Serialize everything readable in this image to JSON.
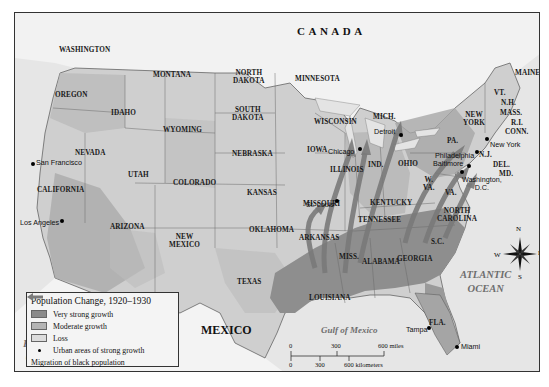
{
  "map": {
    "title": "Population Change, 1920–1930",
    "countries": {
      "canada": "CANADA",
      "mexico": "MEXICO"
    },
    "water_bodies": {
      "pacific": [
        "PACIFIC",
        "OCEAN"
      ],
      "atlantic": [
        "ATLANTIC",
        "OCEAN"
      ],
      "gulf": "Gulf of Mexico"
    },
    "states": {
      "washington": "WASHINGTON",
      "oregon": "OREGON",
      "idaho": "IDAHO",
      "montana": "MONTANA",
      "wyoming": "WYOMING",
      "nevada": "NEVADA",
      "california": "CALIFORNIA",
      "utah": "UTAH",
      "colorado": "COLORADO",
      "arizona": "ARIZONA",
      "new_mexico": [
        "NEW",
        "MEXICO"
      ],
      "north_dakota": [
        "NORTH",
        "DAKOTA"
      ],
      "south_dakota": [
        "SOUTH",
        "DAKOTA"
      ],
      "nebraska": "NEBRASKA",
      "kansas": "KANSAS",
      "oklahoma": "OKLAHOMA",
      "texas": "TEXAS",
      "minnesota": "MINNESOTA",
      "iowa": "IOWA",
      "missouri": "MISSOURI",
      "arkansas": "ARKANSAS",
      "louisiana": "LOUISIANA",
      "wisconsin": "WISCONSIN",
      "illinois": "ILLINOIS",
      "michigan": "MICH.",
      "indiana": "IND.",
      "ohio": "OHIO",
      "kentucky": "KENTUCKY",
      "tennessee": "TENNESSEE",
      "mississippi": "MISS.",
      "alabama": "ALABAMA",
      "georgia": "GEORGIA",
      "florida": "FLA.",
      "south_carolina": "S.C.",
      "north_carolina": [
        "NORTH",
        "CAROLINA"
      ],
      "virginia": "VA.",
      "west_virginia": [
        "W.",
        "VA."
      ],
      "pennsylvania": "PA.",
      "new_york": [
        "NEW",
        "YORK"
      ],
      "new_jersey": "N.J.",
      "delaware": "DEL.",
      "maryland": "MD.",
      "vermont": "VT.",
      "new_hampshire": "N.H.",
      "massachusetts": "MASS.",
      "rhode_island": "R.I.",
      "connecticut": "CONN.",
      "maine": "MAINE"
    },
    "cities": {
      "san_francisco": "San Francisco",
      "los_angeles": "Los Angeles",
      "chicago": "Chicago",
      "detroit": "Detroit",
      "st_louis": "St. Louis",
      "philadelphia": "Philadelphia",
      "baltimore": "Baltimore",
      "washington_dc": [
        "Washington,",
        "D.C."
      ],
      "new_york": "New York",
      "tampa": "Tampa",
      "miami": "Miami"
    },
    "compass": {
      "n": "N",
      "s": "S",
      "e": "E",
      "w": "W"
    },
    "scale": {
      "miles_ticks": [
        "0",
        "300",
        "600 miles"
      ],
      "km_ticks": [
        "0",
        "300",
        "600 kilometers"
      ]
    }
  },
  "legend": {
    "title": "Population Change, 1920–1930",
    "items": [
      {
        "label": "Very strong growth",
        "swatch": "#8a8a8a"
      },
      {
        "label": "Moderate growth",
        "swatch": "#b4b4b4"
      },
      {
        "label": "Loss",
        "swatch": "#dcdcdc"
      },
      {
        "label": "Urban areas of strong growth",
        "symbol": "dot"
      },
      {
        "label": "Migration of black population",
        "symbol": "arrow"
      }
    ]
  },
  "colors": {
    "very_strong": "#8a8a8a",
    "moderate": "#b4b4b4",
    "loss": "#dcdcdc",
    "water": "#e8e8e8",
    "foreign_land": "#efefef",
    "arrow": "#7a7a7a"
  }
}
